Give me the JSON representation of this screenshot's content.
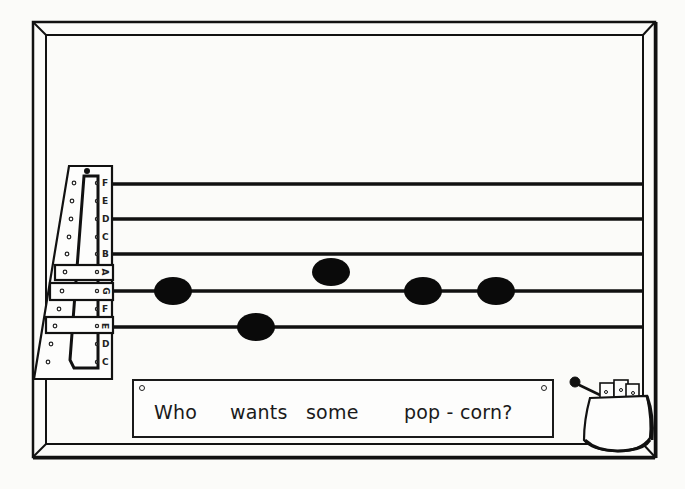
{
  "illustration": {
    "subject": "music staff board with note-name slide rule and popcorn cup",
    "colors": {
      "ink": "#111111",
      "paper": "#fbfbf9",
      "note": "#0a0a0a"
    }
  },
  "note_slide": {
    "labels": [
      "F",
      "E",
      "D",
      "C",
      "B",
      "A",
      "G",
      "F",
      "E",
      "D",
      "C"
    ]
  },
  "staff": {
    "lines": [
      "F",
      "D",
      "B",
      "G",
      "E"
    ],
    "notes": [
      {
        "pitch": "G",
        "x": 173,
        "y": 291
      },
      {
        "pitch": "E",
        "x": 256,
        "y": 327
      },
      {
        "pitch": "A",
        "x": 330,
        "y": 272
      },
      {
        "pitch": "G",
        "x": 423,
        "y": 291
      },
      {
        "pitch": "G",
        "x": 496,
        "y": 291
      }
    ]
  },
  "sign": {
    "words": [
      "Who",
      "wants",
      "some",
      "pop - corn?"
    ]
  },
  "popcorn_cup": {
    "icon": "cup-with-cards-and-mallet-icon"
  }
}
